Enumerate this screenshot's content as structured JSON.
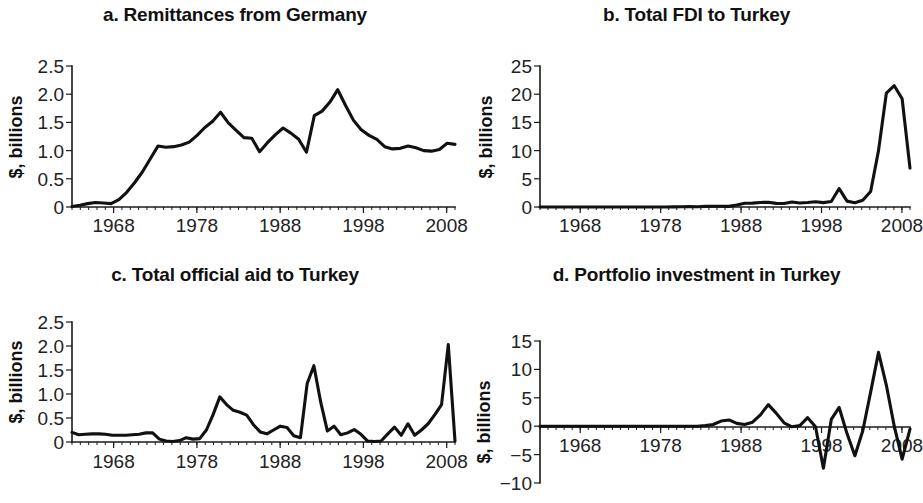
{
  "figure": {
    "background": "#ffffff",
    "line_color": "#111111",
    "text_color": "#111111"
  },
  "panels": [
    {
      "key": "a",
      "title": "a. Remittances from Germany",
      "ylabel": "$, billions",
      "ytick_labels": [
        "2.5",
        "2.0",
        "1.5",
        "1.0",
        "0.5",
        "0"
      ],
      "xtick_labels": [
        "1968",
        "1978",
        "1988",
        "1998",
        "2008"
      ]
    },
    {
      "key": "b",
      "title": "b. Total FDI to Turkey",
      "ylabel": "$, billions",
      "ytick_labels": [
        "25",
        "20",
        "15",
        "10",
        "5",
        "0"
      ],
      "xtick_labels": [
        "1968",
        "1978",
        "1988",
        "1998",
        "2008"
      ]
    },
    {
      "key": "c",
      "title": "c. Total official aid to Turkey",
      "ylabel": "$, billions",
      "ytick_labels": [
        "2.5",
        "2.0",
        "1.5",
        "1.0",
        "0.5",
        "0"
      ],
      "xtick_labels": [
        "1968",
        "1978",
        "1988",
        "1998",
        "2008"
      ]
    },
    {
      "key": "d",
      "title": "d. Portfolio investment in Turkey",
      "ylabel": "$, billions",
      "ytick_labels": [
        "15",
        "10",
        "5",
        "0",
        "−5",
        "−10"
      ],
      "xtick_labels": [
        "1968",
        "1978",
        "1988",
        "1998",
        "2008"
      ]
    }
  ],
  "chart_data": [
    {
      "type": "line",
      "panel": "a",
      "title": "a. Remittances from Germany",
      "xlabel": "",
      "ylabel": "$, billions",
      "xlim": [
        1963,
        2009
      ],
      "ylim": [
        0,
        2.5
      ],
      "yticks": [
        0,
        0.5,
        1.0,
        1.5,
        2.0,
        2.5
      ],
      "xticks": [
        1968,
        1978,
        1988,
        1998,
        2008
      ],
      "grid": false,
      "legend": "none",
      "x": [
        1963,
        1964,
        1965,
        1966,
        1967,
        1968,
        1969,
        1970,
        1971,
        1972,
        1973,
        1974,
        1975,
        1976,
        1977,
        1978,
        1979,
        1980,
        1981,
        1982,
        1983,
        1984,
        1985,
        1986,
        1987,
        1988,
        1989,
        1990,
        1991,
        1992,
        1993,
        1994,
        1995,
        1996,
        1997,
        1998,
        1999,
        2000,
        2001,
        2002,
        2003,
        2004,
        2005,
        2006,
        2007,
        2008
      ],
      "values": [
        0.01,
        0.03,
        0.06,
        0.08,
        0.07,
        0.06,
        0.13,
        0.26,
        0.43,
        0.62,
        0.85,
        1.08,
        1.06,
        1.07,
        1.1,
        1.15,
        1.27,
        1.41,
        1.52,
        1.68,
        1.49,
        1.36,
        1.23,
        1.22,
        0.98,
        1.14,
        1.28,
        1.4,
        1.31,
        1.2,
        0.97,
        1.62,
        1.7,
        1.86,
        2.08,
        1.8,
        1.54,
        1.37,
        1.27,
        1.2,
        1.07,
        1.03,
        1.04,
        1.08,
        1.05,
        1.0,
        0.99,
        1.02,
        1.13,
        1.11
      ]
    },
    {
      "type": "line",
      "panel": "b",
      "title": "b. Total FDI to Turkey",
      "xlabel": "",
      "ylabel": "$, billions",
      "xlim": [
        1963,
        2009
      ],
      "ylim": [
        0,
        25
      ],
      "yticks": [
        0,
        5,
        10,
        15,
        20,
        25
      ],
      "xticks": [
        1968,
        1978,
        1988,
        1998,
        2008
      ],
      "grid": false,
      "legend": "none",
      "x": [
        1963,
        1964,
        1965,
        1966,
        1967,
        1968,
        1969,
        1970,
        1971,
        1972,
        1973,
        1974,
        1975,
        1976,
        1977,
        1978,
        1979,
        1980,
        1981,
        1982,
        1983,
        1984,
        1985,
        1986,
        1987,
        1988,
        1989,
        1990,
        1991,
        1992,
        1993,
        1994,
        1995,
        1996,
        1997,
        1998,
        1999,
        2000,
        2001,
        2002,
        2003,
        2004,
        2005,
        2006,
        2007,
        2008
      ],
      "values": [
        0.0,
        0.0,
        0.0,
        0.0,
        0.0,
        0.0,
        0.0,
        0.0,
        0.0,
        0.0,
        0.0,
        0.0,
        0.0,
        0.0,
        0.0,
        0.0,
        0.0,
        0.02,
        0.05,
        0.06,
        0.05,
        0.11,
        0.13,
        0.13,
        0.11,
        0.35,
        0.66,
        0.68,
        0.81,
        0.84,
        0.64,
        0.61,
        0.89,
        0.72,
        0.81,
        0.94,
        0.78,
        0.98,
        3.27,
        1.04,
        0.75,
        1.18,
        2.75,
        10.0,
        20.2,
        21.5,
        19.2,
        6.9
      ]
    },
    {
      "type": "line",
      "panel": "c",
      "title": "c. Total official aid to Turkey",
      "xlabel": "",
      "ylabel": "$, billions",
      "xlim": [
        1963,
        2009
      ],
      "ylim": [
        0,
        2.5
      ],
      "yticks": [
        0,
        0.5,
        1.0,
        1.5,
        2.0,
        2.5
      ],
      "xticks": [
        1968,
        1978,
        1988,
        1998,
        2008
      ],
      "grid": false,
      "legend": "none",
      "x": [
        1963,
        1964,
        1965,
        1966,
        1967,
        1968,
        1969,
        1970,
        1971,
        1972,
        1973,
        1974,
        1975,
        1976,
        1977,
        1978,
        1979,
        1980,
        1981,
        1982,
        1983,
        1984,
        1985,
        1986,
        1987,
        1988,
        1989,
        1990,
        1991,
        1992,
        1993,
        1994,
        1995,
        1996,
        1997,
        1998,
        1999,
        2000,
        2001,
        2002,
        2003,
        2004,
        2005,
        2006,
        2007,
        2008
      ],
      "values": [
        0.2,
        0.15,
        0.16,
        0.17,
        0.17,
        0.16,
        0.14,
        0.14,
        0.14,
        0.15,
        0.16,
        0.19,
        0.19,
        0.06,
        0.02,
        0.01,
        0.03,
        0.09,
        0.06,
        0.07,
        0.25,
        0.57,
        0.94,
        0.78,
        0.66,
        0.62,
        0.56,
        0.36,
        0.21,
        0.17,
        0.25,
        0.33,
        0.3,
        0.13,
        0.09,
        1.22,
        1.59,
        0.84,
        0.23,
        0.33,
        0.15,
        0.19,
        0.26,
        0.16,
        0.02,
        0.01,
        0.02,
        0.17,
        0.31,
        0.14,
        0.38,
        0.14,
        0.25,
        0.38,
        0.57,
        0.78,
        2.03,
        0.02
      ]
    },
    {
      "type": "line",
      "panel": "d",
      "title": "d. Portfolio investment in Turkey",
      "xlabel": "",
      "ylabel": "$, billions",
      "xlim": [
        1963,
        2009
      ],
      "ylim": [
        -10,
        15
      ],
      "yticks": [
        -10,
        -5,
        0,
        5,
        10,
        15
      ],
      "xticks": [
        1968,
        1978,
        1988,
        1998,
        2008
      ],
      "grid": false,
      "legend": "none",
      "x": [
        1963,
        1964,
        1965,
        1966,
        1967,
        1968,
        1969,
        1970,
        1971,
        1972,
        1973,
        1974,
        1975,
        1976,
        1977,
        1978,
        1979,
        1980,
        1981,
        1982,
        1983,
        1984,
        1985,
        1986,
        1987,
        1988,
        1989,
        1990,
        1991,
        1992,
        1993,
        1994,
        1995,
        1996,
        1997,
        1998,
        1999,
        2000,
        2001,
        2002,
        2003,
        2004,
        2005,
        2006,
        2007,
        2008
      ],
      "values": [
        0,
        0,
        0,
        0,
        0,
        0,
        0,
        0,
        0,
        0,
        0,
        0,
        0,
        0,
        0,
        0,
        0,
        0,
        0,
        0,
        0,
        0.1,
        0.3,
        0.9,
        1.1,
        0.5,
        0.3,
        0.7,
        2.0,
        3.8,
        2.3,
        0.6,
        -0.1,
        0.1,
        1.5,
        -0.1,
        -7.4,
        1.2,
        3.3,
        -1.3,
        -5.2,
        -0.8,
        6.0,
        13.0,
        7.2,
        0.0,
        -5.8,
        -0.5
      ]
    }
  ]
}
